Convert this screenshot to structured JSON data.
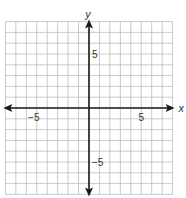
{
  "chart_data": {
    "type": "scatter",
    "title": "",
    "xlabel": "x",
    "ylabel": "y",
    "xlim": [
      -8,
      8
    ],
    "ylim": [
      -8,
      8
    ],
    "grid": true,
    "grid_step": 1,
    "x_tick_labels": [
      {
        "value": -5,
        "label": "−5"
      },
      {
        "value": 5,
        "label": "5"
      }
    ],
    "y_tick_labels": [
      {
        "value": 5,
        "label": "5"
      },
      {
        "value": -5,
        "label": "−5"
      }
    ],
    "series": [],
    "axes_arrows": true
  },
  "style": {
    "grid_color": "#bdbdbd",
    "axis_color": "#1a1a1a",
    "label_color": "#333333"
  },
  "layout": {
    "origin_px": [
      89,
      108
    ],
    "unit_px_x": 10.45,
    "unit_px_y": 10.8
  }
}
